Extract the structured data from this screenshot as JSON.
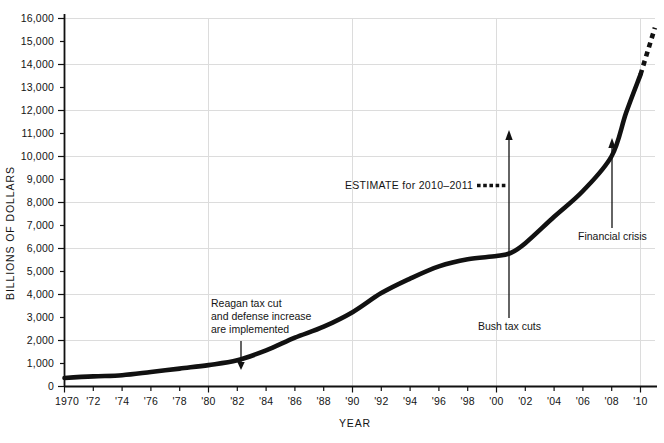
{
  "chart_data": {
    "type": "line",
    "title": "",
    "xlabel": "YEAR",
    "ylabel": "BILLIONS OF DOLLARS",
    "xlim": [
      1970,
      2011
    ],
    "ylim": [
      0,
      16000
    ],
    "grid": "horizontal gridlines every 2,000; vertical gridlines every 10 years",
    "legend_position": "inside-center",
    "y_ticks": [
      0,
      1000,
      2000,
      3000,
      4000,
      5000,
      6000,
      7000,
      8000,
      9000,
      10000,
      11000,
      12000,
      13000,
      14000,
      15000,
      16000
    ],
    "y_tick_labels": [
      "0",
      "1,000",
      "2,000",
      "3,000",
      "4,000",
      "5,000",
      "6,000",
      "7,000",
      "8,000",
      "9,000",
      "10,000",
      "11,000",
      "12,000",
      "13,000",
      "14,000",
      "15,000",
      "16,000"
    ],
    "y_gridline_values": [
      2000,
      4000,
      6000,
      8000,
      10000,
      12000,
      14000,
      16000
    ],
    "x_ticks": [
      1970,
      1972,
      1974,
      1976,
      1978,
      1980,
      1982,
      1984,
      1986,
      1988,
      1990,
      1992,
      1994,
      1996,
      1998,
      2000,
      2002,
      2004,
      2006,
      2008,
      2010
    ],
    "x_tick_labels": [
      "1970",
      "'72",
      "'74",
      "'76",
      "'78",
      "'80",
      "'82",
      "'84",
      "'86",
      "'88",
      "'90",
      "'92",
      "'94",
      "'96",
      "'98",
      "'00",
      "'02",
      "'04",
      "'06",
      "'08",
      "'10"
    ],
    "x_gridline_values": [
      1980,
      1990,
      2000,
      2010
    ],
    "series": [
      {
        "name": "National debt",
        "style": "solid",
        "color": "#111111",
        "x": [
          1970,
          1972,
          1974,
          1976,
          1978,
          1980,
          1982,
          1984,
          1986,
          1988,
          1990,
          1992,
          1994,
          1996,
          1998,
          2000,
          2001,
          2002,
          2004,
          2006,
          2008,
          2009,
          2010
        ],
        "values": [
          370,
          440,
          490,
          630,
          780,
          930,
          1140,
          1570,
          2120,
          2600,
          3230,
          4060,
          4690,
          5220,
          5530,
          5670,
          5810,
          6230,
          7380,
          8500,
          10020,
          11900,
          13560
        ]
      },
      {
        "name": "ESTIMATE for 2010-2011",
        "style": "dotted",
        "color": "#111111",
        "x": [
          2010,
          2011
        ],
        "values": [
          13560,
          15600
        ]
      }
    ],
    "annotations": [
      {
        "id": "reagan",
        "lines": [
          "Reagan tax cut",
          "and defense increase",
          "are implemented"
        ],
        "arrow": "down",
        "target_x": 1982,
        "target_y": 1140
      },
      {
        "id": "bush",
        "lines": [
          "Bush tax cuts"
        ],
        "arrow": "up",
        "target_x": 2001,
        "target_y": 5810
      },
      {
        "id": "crisis",
        "lines": [
          "Financial crisis"
        ],
        "arrow": "up",
        "target_x": 2008,
        "target_y": 10020
      }
    ],
    "legend": [
      {
        "label": "ESTIMATE for 2010–2011",
        "style": "dotted"
      }
    ]
  },
  "axes": {
    "y_title": "BILLIONS OF DOLLARS",
    "x_title": "YEAR"
  },
  "ylabels": {
    "t16": "16,000",
    "t15": "15,000",
    "t14": "14,000",
    "t13": "13,000",
    "t12": "12,000",
    "t11": "11,000",
    "t10": "10,000",
    "t9": "9,000",
    "t8": "8,000",
    "t7": "7,000",
    "t6": "6,000",
    "t5": "5,000",
    "t4": "4,000",
    "t3": "3,000",
    "t2": "2,000",
    "t1": "1,000",
    "t0": "0"
  },
  "xlabels": {
    "x1970": "1970",
    "x1972": "'72",
    "x1974": "'74",
    "x1976": "'76",
    "x1978": "'78",
    "x1980": "'80",
    "x1982": "'82",
    "x1984": "'84",
    "x1986": "'86",
    "x1988": "'88",
    "x1990": "'90",
    "x1992": "'92",
    "x1994": "'94",
    "x1996": "'96",
    "x1998": "'98",
    "x2000": "'00",
    "x2002": "'02",
    "x2004": "'04",
    "x2006": "'06",
    "x2008": "'08",
    "x2010": "'10"
  },
  "annotations": {
    "reagan": {
      "line1": "Reagan tax cut",
      "line2": "and defense increase",
      "line3": "are implemented"
    },
    "bush": {
      "line1": "Bush tax cuts"
    },
    "crisis": {
      "line1": "Financial crisis"
    }
  },
  "legend": {
    "estimate_label": "ESTIMATE for 2010–2011"
  },
  "colors": {
    "line": "#111111",
    "grid": "#d8d8d8",
    "axis": "#111111",
    "text": "#141414",
    "background": "#ffffff"
  }
}
